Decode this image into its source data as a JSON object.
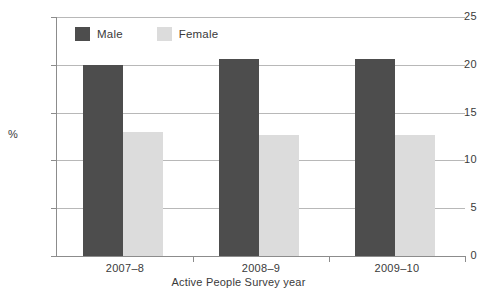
{
  "chart_data": {
    "type": "bar",
    "title": "",
    "subtitle": "",
    "categories": [
      "2007–8",
      "2008–9",
      "2009–10"
    ],
    "series": [
      {
        "name": "Male",
        "values": [
          20.0,
          20.6,
          20.6
        ],
        "color": "#4d4d4d"
      },
      {
        "name": "Female",
        "values": [
          13.0,
          12.7,
          12.7
        ],
        "color": "#dcdcdc"
      }
    ],
    "xlabel": "Active People Survey year",
    "ylabel": "%",
    "ylim": [
      0,
      25
    ],
    "ytick_labels": [
      "0",
      "5",
      "10",
      "15",
      "20",
      "25"
    ],
    "ytick_values": [
      0,
      5,
      10,
      15,
      20,
      25
    ],
    "grid": "horizontal",
    "legend_position": "top-left-inside"
  },
  "legend": {
    "entries": [
      {
        "label": "Male",
        "swatch_name": "legend-swatch-male"
      },
      {
        "label": "Female",
        "swatch_name": "legend-swatch-female"
      }
    ]
  },
  "axes": {
    "y_title": "%",
    "x_title": "Active People Survey year"
  },
  "colors": {
    "male": "#4d4d4d",
    "female": "#dcdcdc",
    "gridline": "#b8b8b8",
    "axis": "#8c8c8c",
    "text": "#3a3a3a",
    "background": "#ffffff"
  }
}
